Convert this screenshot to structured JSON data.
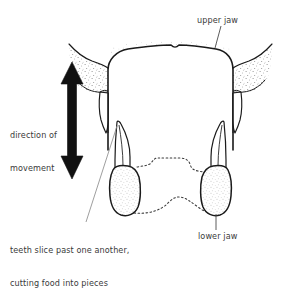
{
  "figure": {
    "background_color": "#ffffff",
    "ink_color": "#1a1a1a",
    "text_color": "#3a3a3a",
    "stipple_color": "#8a8a8a"
  },
  "labels": {
    "upper_jaw": "upper jaw",
    "lower_jaw": "lower jaw",
    "direction_line1": "direction of",
    "direction_line2": "movement",
    "teeth_note_line1": "teeth slice past one another,",
    "teeth_note_line2": "cutting food into pieces"
  },
  "icons": {
    "arrow": "double-headed-vertical-arrow",
    "leader_upper_jaw": "leader-line",
    "leader_lower_jaw": "leader-line",
    "leader_teeth_note": "leader-line"
  },
  "parts": {
    "upper_jaw_plate": "upper-jaw-plate",
    "upper_left_fang": "upper-left-fang",
    "upper_right_fang": "upper-right-fang",
    "lower_left_tooth": "lower-left-tooth",
    "lower_right_tooth": "lower-right-tooth",
    "hidden_lower_jaw_outline": "hidden-lower-jaw-dotted-outline"
  }
}
